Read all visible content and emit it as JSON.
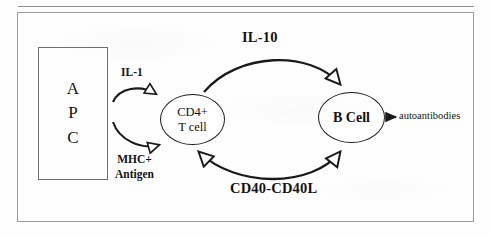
{
  "page": {
    "cut_off_header_text": "·   ·    ·     ·      ·    ·     ·",
    "background_color": "#ffffff",
    "line_color": "#1a1a1a",
    "frame_color": "#9a9a9a"
  },
  "diagram": {
    "nodes": {
      "apc": {
        "name": "APC",
        "letters": [
          "A",
          "P",
          "C"
        ],
        "shape": "rectangle"
      },
      "t_cell": {
        "line1": "CD4+",
        "line2": "T cell",
        "shape": "ellipse"
      },
      "b_cell": {
        "label": "B Cell",
        "shape": "ellipse"
      }
    },
    "edge_labels": {
      "il1": "IL-1",
      "mhc_line1": "MHC+",
      "mhc_line2": "Antigen",
      "il10": "IL-10",
      "cd40": "CD40-CD40L",
      "autoantibodies": "autoantibodies"
    },
    "edges": [
      {
        "id": "apc-to-tcell-il1",
        "from": "apc",
        "to": "t_cell",
        "label": "IL-1",
        "style": "curved",
        "arrowhead": "hollow",
        "direction": "one-way"
      },
      {
        "id": "apc-to-tcell-mhc",
        "from": "apc",
        "to": "t_cell",
        "label": "MHC+ Antigen",
        "style": "curved",
        "arrowhead": "hollow",
        "direction": "one-way"
      },
      {
        "id": "tcell-to-bcell-il10",
        "from": "t_cell",
        "to": "b_cell",
        "label": "IL-10",
        "style": "arc-above",
        "arrowhead": "hollow",
        "direction": "one-way"
      },
      {
        "id": "tcell-bcell-cd40",
        "from": "t_cell",
        "to": "b_cell",
        "label": "CD40-CD40L",
        "style": "arc-below",
        "arrowhead": "hollow",
        "direction": "bidirectional"
      },
      {
        "id": "bcell-to-autoantibodies",
        "from": "b_cell",
        "to": "autoantibodies",
        "label": "autoantibodies",
        "style": "straight",
        "arrowhead": "solid",
        "direction": "one-way"
      }
    ]
  }
}
